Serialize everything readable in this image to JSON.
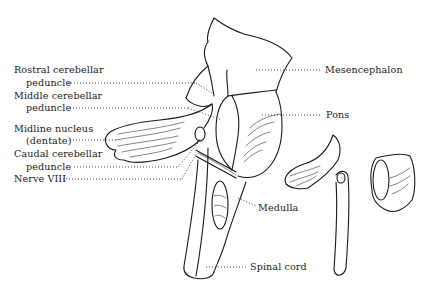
{
  "figure": {
    "type": "anatomical line drawing"
  },
  "labels": {
    "rostral_1": "Rostral cerebellar",
    "rostral_2": "peduncle",
    "middle_1": "Middle cerebellar",
    "middle_2": "peduncle",
    "midline_1": "Midline nucleus",
    "midline_2": "(dentate)",
    "caudal_1": "Caudal cerebellar",
    "caudal_2": "peduncle",
    "nerve": "Nerve VIII",
    "mesencephalon": "Mesencephalon",
    "pons": "Pons",
    "medulla": "Medulla",
    "spinal_cord": "Spinal cord"
  },
  "colors": {
    "line": "#1a1a1a",
    "background": "#ffffff"
  }
}
